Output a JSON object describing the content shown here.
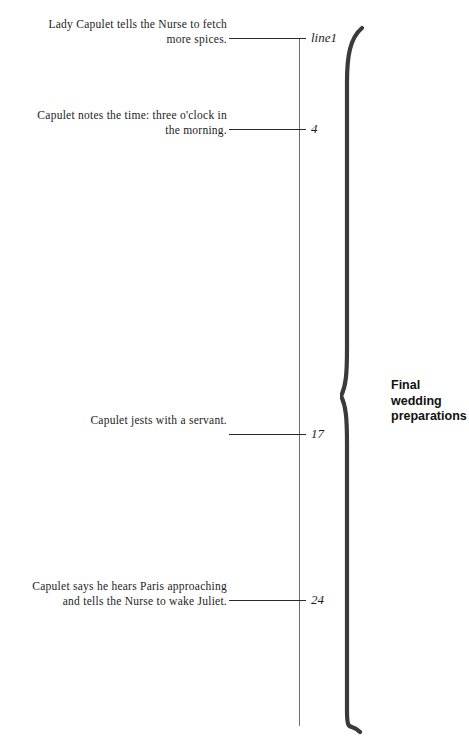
{
  "figure": {
    "axis": {
      "orientation": "vertical",
      "start_y": 38,
      "end_y": 726,
      "color": "#6d6f72"
    },
    "group": {
      "label": "Final wedding\npreparations",
      "brace_color": "#3a3a3a"
    },
    "events": [
      {
        "tick_label": "line1",
        "line_number": 1,
        "y": 38,
        "text": "Lady Capulet tells the Nurse to fetch\nmore spices."
      },
      {
        "tick_label": "4",
        "line_number": 4,
        "y": 129,
        "text": "Capulet notes the time: three o'clock in\nthe morning."
      },
      {
        "tick_label": "17",
        "line_number": 17,
        "y": 434,
        "text": "Capulet jests with a servant."
      },
      {
        "tick_label": "24",
        "line_number": 24,
        "y": 600,
        "text": "Capulet says he hears Paris approaching\nand tells the Nurse to wake Juliet."
      }
    ]
  },
  "chart_data": {
    "type": "timeline",
    "title": "Final wedding preparations",
    "xlabel": "",
    "ylabel": "Line number",
    "axis_orientation": "vertical",
    "axis_range": [
      1,
      24
    ],
    "grid": false,
    "legend": "none",
    "categories": [
      "line1",
      "4",
      "17",
      "24"
    ],
    "values": [
      1,
      4,
      17,
      24
    ],
    "annotations": [
      "Lady Capulet tells the Nurse to fetch more spices.",
      "Capulet notes the time: three o'clock in the morning.",
      "Capulet jests with a servant.",
      "Capulet says he hears Paris approaching and tells the Nurse to wake Juliet."
    ],
    "group_bracket": {
      "label": "Final wedding preparations",
      "covers": [
        1,
        24
      ]
    }
  }
}
